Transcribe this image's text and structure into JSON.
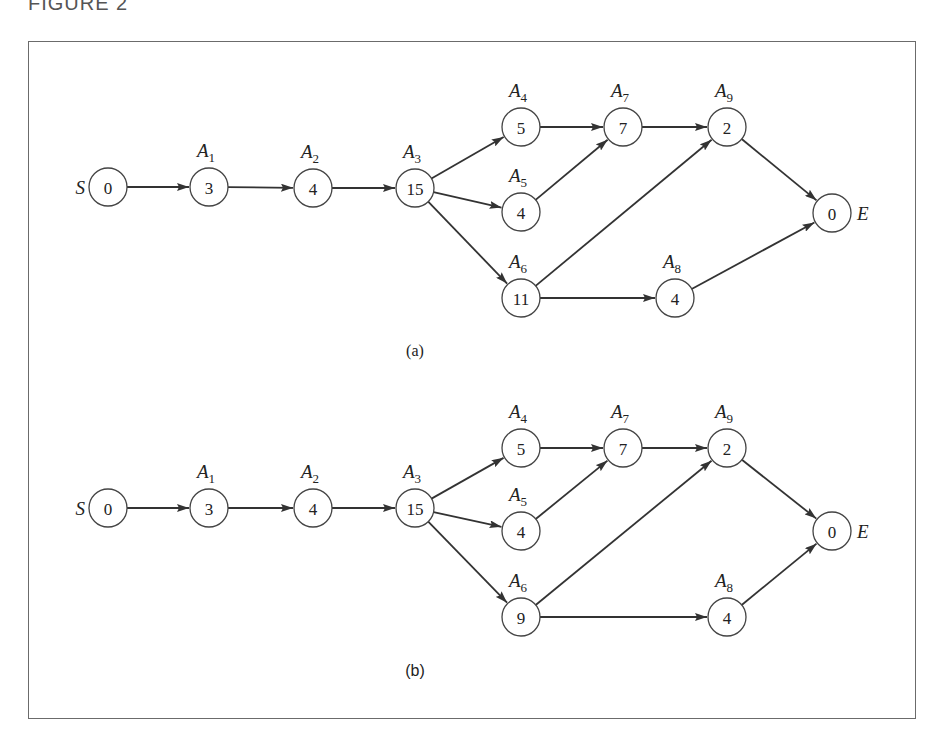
{
  "figure": {
    "label": "FIGURE 2",
    "panels": [
      {
        "id": "a",
        "caption": "(a)",
        "nodes": [
          {
            "id": "S",
            "name": "S",
            "sub": "",
            "value": "0",
            "x": 108,
            "y": 187,
            "label_pos": "left"
          },
          {
            "id": "A1",
            "name": "A",
            "sub": "1",
            "value": "3",
            "x": 209,
            "y": 187,
            "label_pos": "top"
          },
          {
            "id": "A2",
            "name": "A",
            "sub": "2",
            "value": "4",
            "x": 313,
            "y": 188,
            "label_pos": "top"
          },
          {
            "id": "A3",
            "name": "A",
            "sub": "3",
            "value": "15",
            "x": 415,
            "y": 188,
            "label_pos": "top"
          },
          {
            "id": "A4",
            "name": "A",
            "sub": "4",
            "value": "5",
            "x": 521,
            "y": 127,
            "label_pos": "top"
          },
          {
            "id": "A5",
            "name": "A",
            "sub": "5",
            "value": "4",
            "x": 521,
            "y": 212,
            "label_pos": "top"
          },
          {
            "id": "A6",
            "name": "A",
            "sub": "6",
            "value": "11",
            "x": 521,
            "y": 298,
            "label_pos": "top"
          },
          {
            "id": "A7",
            "name": "A",
            "sub": "7",
            "value": "7",
            "x": 623,
            "y": 127,
            "label_pos": "top"
          },
          {
            "id": "A8",
            "name": "A",
            "sub": "8",
            "value": "4",
            "x": 675,
            "y": 298,
            "label_pos": "top"
          },
          {
            "id": "A9",
            "name": "A",
            "sub": "9",
            "value": "2",
            "x": 727,
            "y": 127,
            "label_pos": "top"
          },
          {
            "id": "E",
            "name": "E",
            "sub": "",
            "value": "0",
            "x": 832,
            "y": 213,
            "label_pos": "right"
          }
        ],
        "edges": [
          [
            "S",
            "A1"
          ],
          [
            "A1",
            "A2"
          ],
          [
            "A2",
            "A3"
          ],
          [
            "A3",
            "A4"
          ],
          [
            "A3",
            "A5"
          ],
          [
            "A3",
            "A6"
          ],
          [
            "A4",
            "A7"
          ],
          [
            "A5",
            "A7"
          ],
          [
            "A7",
            "A9"
          ],
          [
            "A6",
            "A9"
          ],
          [
            "A6",
            "A8"
          ],
          [
            "A9",
            "E"
          ],
          [
            "A8",
            "E"
          ]
        ],
        "caption_x": 415,
        "caption_y": 356
      },
      {
        "id": "b",
        "caption": "(b)",
        "nodes": [
          {
            "id": "S",
            "name": "S",
            "sub": "",
            "value": "0",
            "x": 108,
            "y": 508,
            "label_pos": "left"
          },
          {
            "id": "A1",
            "name": "A",
            "sub": "1",
            "value": "3",
            "x": 209,
            "y": 508,
            "label_pos": "top"
          },
          {
            "id": "A2",
            "name": "A",
            "sub": "2",
            "value": "4",
            "x": 313,
            "y": 508,
            "label_pos": "top"
          },
          {
            "id": "A3",
            "name": "A",
            "sub": "3",
            "value": "15",
            "x": 415,
            "y": 508,
            "label_pos": "top"
          },
          {
            "id": "A4",
            "name": "A",
            "sub": "4",
            "value": "5",
            "x": 521,
            "y": 448,
            "label_pos": "top"
          },
          {
            "id": "A5",
            "name": "A",
            "sub": "5",
            "value": "4",
            "x": 521,
            "y": 531,
            "label_pos": "top"
          },
          {
            "id": "A6",
            "name": "A",
            "sub": "6",
            "value": "9",
            "x": 521,
            "y": 617,
            "label_pos": "top"
          },
          {
            "id": "A7",
            "name": "A",
            "sub": "7",
            "value": "7",
            "x": 623,
            "y": 448,
            "label_pos": "top"
          },
          {
            "id": "A8",
            "name": "A",
            "sub": "8",
            "value": "4",
            "x": 727,
            "y": 617,
            "label_pos": "top"
          },
          {
            "id": "A9",
            "name": "A",
            "sub": "9",
            "value": "2",
            "x": 727,
            "y": 448,
            "label_pos": "top"
          },
          {
            "id": "E",
            "name": "E",
            "sub": "",
            "value": "0",
            "x": 832,
            "y": 531,
            "label_pos": "right"
          }
        ],
        "edges": [
          [
            "S",
            "A1"
          ],
          [
            "A1",
            "A2"
          ],
          [
            "A2",
            "A3"
          ],
          [
            "A3",
            "A4"
          ],
          [
            "A3",
            "A5"
          ],
          [
            "A3",
            "A6"
          ],
          [
            "A4",
            "A7"
          ],
          [
            "A5",
            "A7"
          ],
          [
            "A7",
            "A9"
          ],
          [
            "A6",
            "A9"
          ],
          [
            "A6",
            "A8"
          ],
          [
            "A9",
            "E"
          ],
          [
            "A8",
            "E"
          ]
        ],
        "caption_x": 415,
        "caption_y": 676
      }
    ]
  }
}
